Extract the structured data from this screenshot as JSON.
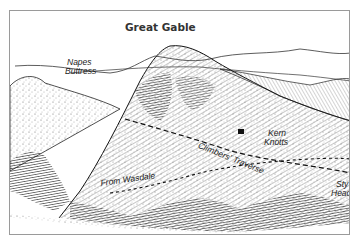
{
  "illustration": {
    "title": "Great Gable",
    "style": "pen-and-ink mountain sketch",
    "ink_color": "#1e1e1e",
    "labels": {
      "napes": [
        "Napes",
        "Buttress"
      ],
      "kern": [
        "Kern",
        "Knotts"
      ],
      "climbers": "Climbers' Traverse",
      "wasdale": "From Wasdale",
      "sty": [
        "Sty",
        "Head"
      ]
    },
    "routes": [
      {
        "name": "Climbers' Traverse",
        "style": "dashed"
      },
      {
        "name": "From Wasdale",
        "style": "dashed"
      }
    ]
  }
}
